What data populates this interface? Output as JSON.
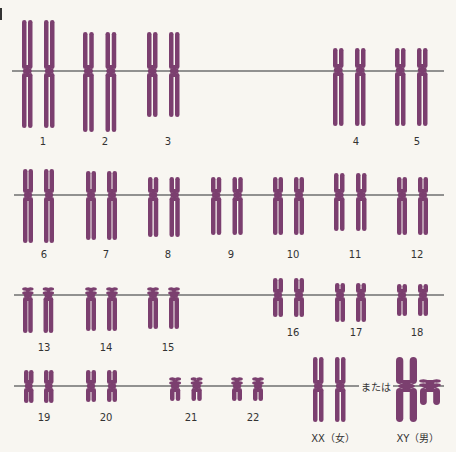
{
  "diagram": {
    "colors": {
      "chromosome": "#7b3f6f",
      "line": "#6f6f6f",
      "background": "#f8f6f1",
      "text": "#333333"
    },
    "guide_lines": [
      {
        "y": 71,
        "x1": 12,
        "x2": 444
      },
      {
        "y": 195,
        "x1": 14,
        "x2": 444
      },
      {
        "y": 295,
        "x1": 14,
        "x2": 444
      },
      {
        "y": 386,
        "x1": 14,
        "x2": 302
      },
      {
        "y": 386,
        "x1": 302,
        "x2": 444
      }
    ],
    "chromosomes": [
      {
        "label": "1",
        "x": 22,
        "top": 20,
        "cen": 71,
        "bottom": 128,
        "w": 42,
        "type": "meta",
        "lx": 43,
        "ly": 142
      },
      {
        "label": "2",
        "x": 83,
        "top": 32,
        "cen": 71,
        "bottom": 132,
        "w": 43,
        "type": "sub",
        "lx": 105,
        "ly": 142
      },
      {
        "label": "3",
        "x": 147,
        "top": 32,
        "cen": 71,
        "bottom": 117,
        "w": 42,
        "type": "meta",
        "lx": 168,
        "ly": 142
      },
      {
        "label": "4",
        "x": 333,
        "top": 48,
        "cen": 70,
        "bottom": 126,
        "w": 42,
        "type": "sub",
        "lx": 356,
        "ly": 142
      },
      {
        "label": "5",
        "x": 395,
        "top": 48,
        "cen": 70,
        "bottom": 126,
        "w": 42,
        "type": "sub",
        "lx": 417,
        "ly": 142
      },
      {
        "label": "6",
        "x": 23,
        "top": 169,
        "cen": 195,
        "bottom": 243,
        "w": 40,
        "type": "sub",
        "lx": 44,
        "ly": 255
      },
      {
        "label": "7",
        "x": 86,
        "top": 171,
        "cen": 195,
        "bottom": 240,
        "w": 40,
        "type": "sub",
        "lx": 106,
        "ly": 255
      },
      {
        "label": "8",
        "x": 148,
        "top": 177,
        "cen": 195,
        "bottom": 237,
        "w": 41,
        "type": "sub",
        "lx": 168,
        "ly": 255
      },
      {
        "label": "9",
        "x": 211,
        "top": 177,
        "cen": 195,
        "bottom": 235,
        "w": 41,
        "type": "sub",
        "lx": 231,
        "ly": 255
      },
      {
        "label": "10",
        "x": 273,
        "top": 177,
        "cen": 195,
        "bottom": 235,
        "w": 40,
        "type": "sub",
        "lx": 293,
        "ly": 255
      },
      {
        "label": "11",
        "x": 334,
        "top": 173,
        "cen": 195,
        "bottom": 231,
        "w": 42,
        "type": "sub",
        "lx": 355,
        "ly": 255
      },
      {
        "label": "12",
        "x": 397,
        "top": 177,
        "cen": 195,
        "bottom": 235,
        "w": 40,
        "type": "sub",
        "lx": 417,
        "ly": 255
      },
      {
        "label": "13",
        "x": 23,
        "top": 287,
        "cen": 295,
        "bottom": 333,
        "w": 39,
        "type": "acro",
        "lx": 44,
        "ly": 348
      },
      {
        "label": "14",
        "x": 86,
        "top": 287,
        "cen": 295,
        "bottom": 331,
        "w": 40,
        "type": "acro",
        "lx": 106,
        "ly": 348
      },
      {
        "label": "15",
        "x": 148,
        "top": 287,
        "cen": 295,
        "bottom": 329,
        "w": 40,
        "type": "acro",
        "lx": 168,
        "ly": 348
      },
      {
        "label": "16",
        "x": 273,
        "top": 278,
        "cen": 295,
        "bottom": 317,
        "w": 40,
        "type": "sub",
        "lx": 293,
        "ly": 333
      },
      {
        "label": "17",
        "x": 335,
        "top": 283,
        "cen": 295,
        "bottom": 322,
        "w": 40,
        "type": "sub",
        "lx": 356,
        "ly": 333
      },
      {
        "label": "18",
        "x": 397,
        "top": 284,
        "cen": 295,
        "bottom": 316,
        "w": 40,
        "type": "sub",
        "lx": 417,
        "ly": 333
      },
      {
        "label": "19",
        "x": 24,
        "top": 370,
        "cen": 386,
        "bottom": 403,
        "w": 38,
        "type": "meta",
        "lx": 44,
        "ly": 418
      },
      {
        "label": "20",
        "x": 86,
        "top": 370,
        "cen": 386,
        "bottom": 402,
        "w": 40,
        "type": "meta",
        "lx": 106,
        "ly": 418
      },
      {
        "label": "21",
        "x": 170,
        "top": 377,
        "cen": 386,
        "bottom": 401,
        "w": 41,
        "type": "acro",
        "lx": 191,
        "ly": 418
      },
      {
        "label": "22",
        "x": 232,
        "top": 377,
        "cen": 386,
        "bottom": 401,
        "w": 40,
        "type": "acro",
        "lx": 253,
        "ly": 418
      },
      {
        "label": "XX (女)",
        "x": 313,
        "top": 357,
        "cen": 386,
        "bottom": 422,
        "w": 42,
        "type": "sub",
        "lx": 333,
        "ly": 436
      },
      {
        "label": "X",
        "x": 396,
        "top": 357,
        "cen": 386,
        "bottom": 422,
        "w": 21,
        "type": "sub",
        "single": true
      },
      {
        "label": "Y",
        "x": 420,
        "top": 379,
        "cen": 386,
        "bottom": 405,
        "w": 20,
        "type": "acro",
        "single": true
      }
    ],
    "sex_labels": {
      "xx": "XX（女）",
      "xy": "XY（男）",
      "or": "または"
    },
    "label_positions": {
      "xy_x": 418,
      "xy_y": 436,
      "or_x": 359,
      "or_y": 379
    }
  }
}
